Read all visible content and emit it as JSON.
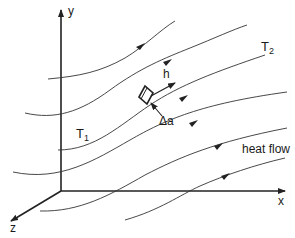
{
  "diagram": {
    "axes": {
      "x_label": "x",
      "y_label": "y",
      "z_label": "z"
    },
    "temperature_labels": {
      "t1": "T",
      "t1_sub": "1",
      "t2": "T",
      "t2_sub": "2"
    },
    "vector_label": "h",
    "area_label": "Δa",
    "flow_label": "heat flow",
    "colors": {
      "line": "#222222",
      "background": "#ffffff"
    },
    "flow_lines_count": 6
  }
}
